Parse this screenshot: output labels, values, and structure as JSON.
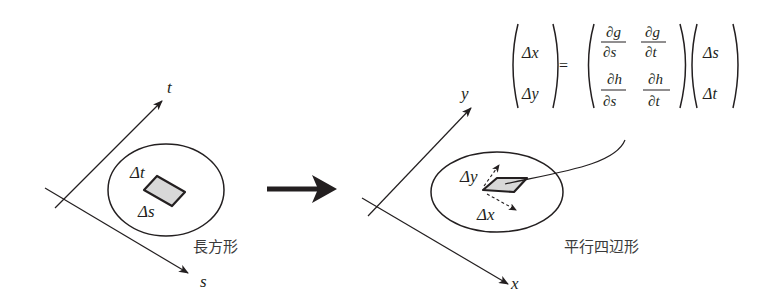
{
  "left_diagram": {
    "axis_t_label": "t",
    "axis_s_label": "s",
    "delta_t_label": "Δt",
    "delta_s_label": "Δs",
    "shape_caption": "長方形"
  },
  "transform_arrow": "right-arrow",
  "right_diagram": {
    "axis_y_label": "y",
    "axis_x_label": "x",
    "delta_y_label": "Δy",
    "delta_x_label": "Δx",
    "shape_caption": "平行四辺形"
  },
  "equation": {
    "lhs": [
      "Δx",
      "Δy"
    ],
    "equals": "=",
    "jacobian": {
      "row1": [
        {
          "num": "∂g",
          "den": "∂s"
        },
        {
          "num": "∂g",
          "den": "∂t"
        }
      ],
      "row2": [
        {
          "num": "∂h",
          "den": "∂s"
        },
        {
          "num": "∂h",
          "den": "∂t"
        }
      ]
    },
    "rhs": [
      "Δs",
      "Δt"
    ]
  },
  "colors": {
    "stroke": "#231f20",
    "shape_fill": "#d8d8d8"
  }
}
